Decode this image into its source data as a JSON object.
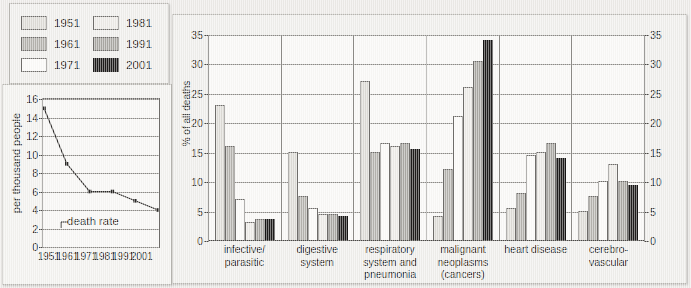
{
  "legend": {
    "name": "year-legend",
    "items": [
      {
        "label": "1951",
        "swatch": "sw-1951",
        "color": "#dddbd6"
      },
      {
        "label": "1961",
        "swatch": "sw-1961",
        "color": "#b4b2ad"
      },
      {
        "label": "1971",
        "swatch": "sw-1971",
        "color": "#fbfaf8"
      },
      {
        "label": "1981",
        "swatch": "sw-1981",
        "color": "#eceae6"
      },
      {
        "label": "1991",
        "swatch": "sw-1991",
        "color": "#a9a7a2"
      },
      {
        "label": "2001",
        "swatch": "sw-2001",
        "color": "#1d1b1a"
      }
    ]
  },
  "chart_data": [
    {
      "id": "death-rate-line",
      "type": "line",
      "title": "",
      "xlabel": "",
      "ylabel": "per thousand people",
      "x": [
        "1951",
        "1961",
        "1971",
        "1981",
        "1991",
        "2001"
      ],
      "series": [
        {
          "name": "death rate",
          "values": [
            15,
            9,
            6,
            6,
            5,
            4
          ]
        }
      ],
      "annotations": [
        "death rate"
      ],
      "ylim": [
        0,
        16
      ],
      "yticks": [
        0,
        2,
        4,
        6,
        8,
        10,
        12,
        14,
        16
      ],
      "grid": true,
      "legend_position": "none"
    },
    {
      "id": "causes-of-death-bars",
      "type": "bar",
      "title": "",
      "xlabel": "",
      "ylabel": "% of all deaths",
      "categories": [
        "infective/\nparasitic",
        "digestive\nsystem",
        "respiratory\nsystem and\npneumonia",
        "malignant\nneoplasms\n(cancers)",
        "heart disease",
        "cerebro-vascular"
      ],
      "series": [
        {
          "name": "1951",
          "values": [
            23,
            15,
            27,
            4,
            5.5,
            5
          ]
        },
        {
          "name": "1961",
          "values": [
            16,
            7.5,
            15,
            12,
            8,
            7.5
          ]
        },
        {
          "name": "1971",
          "values": [
            7,
            5.5,
            16.5,
            21,
            14.5,
            10
          ]
        },
        {
          "name": "1981",
          "values": [
            3,
            4.5,
            16,
            26,
            15,
            13
          ]
        },
        {
          "name": "1991",
          "values": [
            3.5,
            4.5,
            16.5,
            30.5,
            16.5,
            10
          ]
        },
        {
          "name": "2001",
          "values": [
            3.5,
            4,
            15.5,
            34,
            14,
            9.3
          ]
        }
      ],
      "ylim": [
        0,
        35
      ],
      "yticks": [
        0,
        5,
        10,
        15,
        20,
        25,
        30,
        35
      ],
      "yticks_right": [
        0,
        5,
        10,
        15,
        20,
        25,
        30,
        35
      ],
      "grid": true,
      "legend_position": "external-top-left"
    }
  ]
}
